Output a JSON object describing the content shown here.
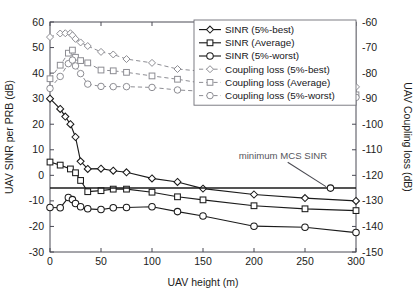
{
  "figure": {
    "corner_artifact": "page-edge-tick"
  },
  "chart_data": {
    "type": "line",
    "title": "",
    "xlabel": "UAV height (m)",
    "ylabel": "UAV SINR per PRB (dB)",
    "y2label": "UAV Coupling loss (dB)",
    "xlim": [
      0,
      300
    ],
    "ylim": [
      -30,
      60
    ],
    "y2lim": [
      -150,
      -60
    ],
    "xticks": [
      0,
      50,
      100,
      150,
      200,
      250,
      300
    ],
    "xticklabels": [
      "0",
      "50",
      "100",
      "150",
      "200",
      "250",
      "300"
    ],
    "yticks": [
      -30,
      -20,
      -10,
      0,
      10,
      20,
      30,
      40,
      50,
      60
    ],
    "yticklabels": [
      "-30",
      "-20",
      "-10",
      "0",
      "10",
      "20",
      "30",
      "40",
      "50",
      "60"
    ],
    "y2ticks": [
      -150,
      -140,
      -130,
      -120,
      -110,
      -100,
      -90,
      -80,
      -70,
      -60
    ],
    "y2ticklabels": [
      "-150",
      "-140",
      "-130",
      "-120",
      "-110",
      "-100",
      "-90",
      "-80",
      "-70",
      "-60"
    ],
    "grid": false,
    "legend_position": "top-right-inside",
    "annotations": [
      {
        "text": "minimum MCS SINR",
        "x": 185,
        "y": 6.5,
        "points_to_x": 275,
        "points_to_y": -5
      }
    ],
    "reference_lines": [
      {
        "name": "minimum-mcs-sinr",
        "axis": "left",
        "value": -5,
        "style": "solid",
        "color": "#1b1b1b"
      }
    ],
    "series": [
      {
        "name": "SINR (5%-best)",
        "axis": "left",
        "marker": "diamond",
        "style": "solid",
        "color": "#1b1b1b",
        "x": [
          0,
          10,
          15,
          20,
          25,
          30,
          37,
          50,
          62,
          75,
          100,
          125,
          150,
          200,
          250,
          300
        ],
        "values": [
          30,
          26,
          23,
          20,
          15,
          5.5,
          2.5,
          2.6,
          1.8,
          1.2,
          -1.2,
          -2.6,
          -5.2,
          -7.5,
          -8.9,
          -10.0
        ]
      },
      {
        "name": "SINR (Average)",
        "axis": "left",
        "marker": "square",
        "style": "solid",
        "color": "#1b1b1b",
        "x": [
          0,
          10,
          20,
          25,
          30,
          37,
          50,
          62,
          75,
          100,
          125,
          150,
          200,
          250,
          300
        ],
        "values": [
          5.2,
          4.0,
          2.5,
          1.0,
          -2.0,
          -6.4,
          -6.0,
          -5.4,
          -5.4,
          -6.6,
          -8.4,
          -9.6,
          -11.9,
          -13.1,
          -13.8
        ]
      },
      {
        "name": "SINR (5%-worst)",
        "axis": "left",
        "marker": "circle",
        "style": "solid",
        "color": "#1b1b1b",
        "x": [
          0,
          10,
          18,
          22,
          25,
          30,
          37,
          50,
          62,
          75,
          100,
          125,
          150,
          200,
          250,
          300
        ],
        "values": [
          -12.6,
          -12.7,
          -8.7,
          -9.5,
          -11.0,
          -12.3,
          -13.1,
          -13.4,
          -12.7,
          -12.6,
          -12.3,
          -14.2,
          -15.9,
          -19.9,
          -20.3,
          -22.4
        ]
      },
      {
        "name": "Coupling loss (5%-best)",
        "axis": "right",
        "marker": "diamond",
        "style": "dashed",
        "color": "#8d8d93",
        "x": [
          0,
          10,
          15,
          20,
          22,
          25,
          30,
          37,
          50,
          62,
          75,
          100,
          125,
          150,
          200,
          250,
          300
        ],
        "values": [
          -65.9,
          -64.5,
          -64.4,
          -64.4,
          -65.2,
          -66.6,
          -68.0,
          -69.4,
          -71.7,
          -72.7,
          -74.5,
          -76.0,
          -78.4,
          -79.3,
          -82.2,
          -83.8,
          -85.4
        ]
      },
      {
        "name": "Coupling loss (Average)",
        "axis": "right",
        "marker": "square",
        "style": "dashed",
        "color": "#8d8d93",
        "x": [
          0,
          10,
          18,
          22,
          25,
          30,
          37,
          50,
          62,
          75,
          100,
          125,
          150,
          200,
          250,
          300
        ],
        "values": [
          -82.2,
          -76.9,
          -72.2,
          -71.0,
          -73.8,
          -75.1,
          -76.0,
          -78.8,
          -79.1,
          -79.7,
          -81.1,
          -82.4,
          -84.0,
          -86.0,
          -87.5,
          -88.5
        ]
      },
      {
        "name": "Coupling loss (5%-worst)",
        "axis": "right",
        "marker": "circle",
        "style": "dashed",
        "color": "#8d8d93",
        "x": [
          0,
          10,
          18,
          22,
          25,
          30,
          37,
          50,
          62,
          75,
          100,
          125,
          150,
          200,
          250,
          300
        ],
        "values": [
          -86.0,
          -81.3,
          -76.3,
          -74.9,
          -77.2,
          -80.2,
          -84.3,
          -85.2,
          -85.3,
          -85.3,
          -85.6,
          -86.6,
          -87.1,
          -87.7,
          -89.3,
          -89.5
        ]
      }
    ],
    "legend": [
      {
        "label": "SINR (5%-best)",
        "marker": "diamond",
        "style": "solid"
      },
      {
        "label": "SINR (Average)",
        "marker": "square",
        "style": "solid"
      },
      {
        "label": "SINR (5%-worst)",
        "marker": "circle",
        "style": "solid"
      },
      {
        "label": "Coupling loss (5%-best)",
        "marker": "diamond",
        "style": "dashed"
      },
      {
        "label": "Coupling loss (Average)",
        "marker": "square",
        "style": "dashed"
      },
      {
        "label": "Coupling loss (5%-worst)",
        "marker": "circle",
        "style": "dashed"
      }
    ]
  }
}
